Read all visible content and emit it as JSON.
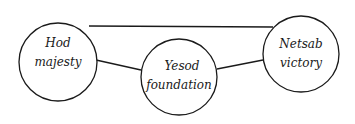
{
  "diagram": {
    "nodes": [
      {
        "id": "hod",
        "line1": "Hod",
        "line2": "majesty"
      },
      {
        "id": "yesod",
        "line1": "Yesod",
        "line2": "foundation"
      },
      {
        "id": "netsah",
        "line1": "Netsab",
        "line2": "victory"
      }
    ],
    "edges": [
      {
        "from": "hod",
        "to": "netsah"
      },
      {
        "from": "hod",
        "to": "yesod"
      },
      {
        "from": "yesod",
        "to": "netsah"
      }
    ],
    "colors": {
      "stroke": "#1a1a1a",
      "background": "#ffffff"
    }
  }
}
